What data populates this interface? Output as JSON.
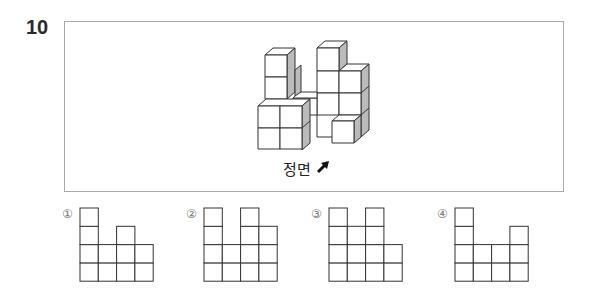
{
  "question": {
    "number": "10",
    "caption": "정면",
    "direction_icon": "arrow-up-right-icon"
  },
  "choices": [
    {
      "label": "①",
      "heights": [
        4,
        2,
        3,
        2
      ]
    },
    {
      "label": "②",
      "heights": [
        4,
        2,
        4,
        3
      ]
    },
    {
      "label": "③",
      "heights": [
        4,
        3,
        4,
        2
      ]
    },
    {
      "label": "④",
      "heights": [
        4,
        2,
        2,
        3
      ]
    }
  ]
}
